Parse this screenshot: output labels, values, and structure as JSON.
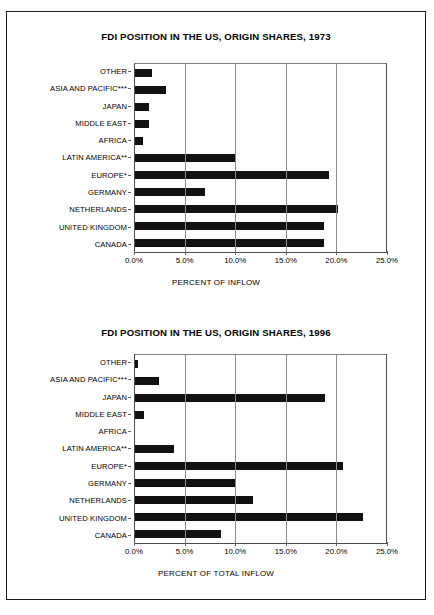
{
  "page": {
    "background": "#ffffff",
    "frame_color": "#1a1a1a",
    "bar_color": "#111111",
    "grid_color": "#8c8c8c"
  },
  "charts": [
    {
      "id": "chart-1973",
      "title": "FDI POSITION IN THE US, ORIGIN SHARES, 1973",
      "xlabel": "PERCENT OF INFLOW",
      "xticks": [
        "0.0%",
        "5.0%",
        "10.0%",
        "15.0%",
        "20.0%",
        "25.0%"
      ],
      "categories": [
        "OTHER",
        "ASIA AND PACIFIC***",
        "JAPAN",
        "MIDDLE EAST",
        "AFRICA",
        "LATIN AMERICA**",
        "EUROPE*",
        "GERMANY",
        "NETHERLANDS",
        "UNITED KINGDOM",
        "CANADA"
      ],
      "values": [
        1.7,
        3.1,
        1.4,
        1.4,
        0.8,
        10.1,
        19.3,
        7.0,
        20.2,
        18.8,
        18.8
      ]
    },
    {
      "id": "chart-1996",
      "title": "FDI POSITION IN THE US, ORIGIN SHARES, 1996",
      "xlabel": "PERCENT OF TOTAL INFLOW",
      "xticks": [
        "0.0%",
        "5.0%",
        "10.0%",
        "15.0%",
        "20.0%",
        "25.0%"
      ],
      "categories": [
        "OTHER",
        "ASIA AND PACIFIC***",
        "JAPAN",
        "MIDDLE EAST",
        "AFRICA",
        "LATIN AMERICA**",
        "EUROPE*",
        "GERMANY",
        "NETHERLANDS",
        "UNITED KINGDOM",
        "CANADA"
      ],
      "values": [
        0.3,
        2.4,
        18.9,
        0.9,
        0.0,
        3.9,
        20.7,
        10.1,
        11.8,
        22.7,
        8.6
      ]
    }
  ],
  "chart_data": [
    {
      "type": "bar",
      "orientation": "horizontal",
      "title": "FDI POSITION IN THE US, ORIGIN SHARES, 1973",
      "xlabel": "PERCENT OF INFLOW",
      "ylabel": "",
      "xlim": [
        0,
        25
      ],
      "xticks": [
        0,
        5,
        10,
        15,
        20,
        25
      ],
      "xticklabels": [
        "0.0%",
        "5.0%",
        "10.0%",
        "15.0%",
        "20.0%",
        "25.0%"
      ],
      "grid": true,
      "legend": false,
      "categories": [
        "OTHER",
        "ASIA AND PACIFIC***",
        "JAPAN",
        "MIDDLE EAST",
        "AFRICA",
        "LATIN AMERICA**",
        "EUROPE*",
        "GERMANY",
        "NETHERLANDS",
        "UNITED KINGDOM",
        "CANADA"
      ],
      "values": [
        1.7,
        3.1,
        1.4,
        1.4,
        0.8,
        10.1,
        19.3,
        7.0,
        20.2,
        18.8,
        18.8
      ]
    },
    {
      "type": "bar",
      "orientation": "horizontal",
      "title": "FDI POSITION IN THE US, ORIGIN SHARES, 1996",
      "xlabel": "PERCENT OF TOTAL INFLOW",
      "ylabel": "",
      "xlim": [
        0,
        25
      ],
      "xticks": [
        0,
        5,
        10,
        15,
        20,
        25
      ],
      "xticklabels": [
        "0.0%",
        "5.0%",
        "10.0%",
        "15.0%",
        "20.0%",
        "25.0%"
      ],
      "grid": true,
      "legend": false,
      "categories": [
        "OTHER",
        "ASIA AND PACIFIC***",
        "JAPAN",
        "MIDDLE EAST",
        "AFRICA",
        "LATIN AMERICA**",
        "EUROPE*",
        "GERMANY",
        "NETHERLANDS",
        "UNITED KINGDOM",
        "CANADA"
      ],
      "values": [
        0.3,
        2.4,
        18.9,
        0.9,
        0.0,
        3.9,
        20.7,
        10.1,
        11.8,
        22.7,
        8.6
      ]
    }
  ]
}
